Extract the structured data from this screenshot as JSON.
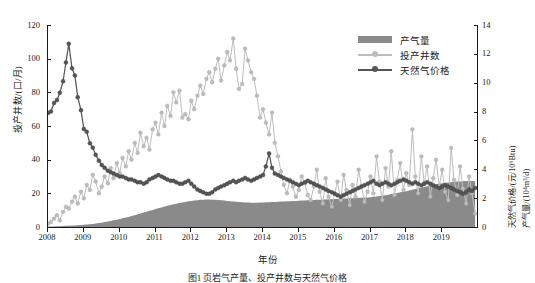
{
  "figure": {
    "caption": "图1   页岩气产量、投产井数与天然气价格"
  },
  "axes": {
    "x": {
      "label": "年份",
      "ticks": [
        "2008",
        "2009",
        "2010",
        "2011",
        "2012",
        "2013",
        "2014",
        "2015",
        "2016",
        "2017",
        "2018",
        "2019"
      ],
      "min": 2008,
      "max": 2020
    },
    "y_left": {
      "label": "投产井数/(口/月)",
      "ticks": [
        "0",
        "20",
        "40",
        "60",
        "80",
        "100",
        "120"
      ],
      "min": 0,
      "max": 120
    },
    "y_right": {
      "label_price": "天然气价格/(元/10⁶Btu)",
      "label_production": "产气量/(10⁴m³/d)",
      "ticks": [
        "0",
        "2",
        "4",
        "6",
        "8",
        "10",
        "12",
        "14"
      ],
      "min": 0,
      "max": 14
    }
  },
  "legend": {
    "position": "top-right",
    "items": [
      {
        "label": "产气量",
        "type": "area",
        "color": "#8a8a8a"
      },
      {
        "label": "投产井数",
        "type": "line",
        "color": "#bdbdbd"
      },
      {
        "label": "天然气价格",
        "type": "line",
        "color": "#565656"
      }
    ]
  },
  "colors": {
    "production_area": "#8a8a8a",
    "wells_line": "#bdbdbd",
    "price_line": "#565656",
    "axis": "#1a1a1a"
  },
  "chart_data": {
    "type": "line",
    "title": "",
    "subtitle": "",
    "xlabel": "年份",
    "ylabel": "投产井数/(口/月)",
    "ylabel_right": "天然气价格/(元/10⁶Btu); 产气量/(10⁴m³/d)",
    "xlim": [
      2008,
      2020
    ],
    "ylim": [
      0,
      120
    ],
    "ylim_right": [
      0,
      14
    ],
    "grid": false,
    "legend_position": "top-right",
    "x": [
      2008.0,
      2008.08,
      2008.17,
      2008.25,
      2008.33,
      2008.42,
      2008.5,
      2008.58,
      2008.67,
      2008.75,
      2008.83,
      2008.92,
      2009.0,
      2009.08,
      2009.17,
      2009.25,
      2009.33,
      2009.42,
      2009.5,
      2009.58,
      2009.67,
      2009.75,
      2009.83,
      2009.92,
      2010.0,
      2010.08,
      2010.17,
      2010.25,
      2010.33,
      2010.42,
      2010.5,
      2010.58,
      2010.67,
      2010.75,
      2010.83,
      2010.92,
      2011.0,
      2011.08,
      2011.17,
      2011.25,
      2011.33,
      2011.42,
      2011.5,
      2011.58,
      2011.67,
      2011.75,
      2011.83,
      2011.92,
      2012.0,
      2012.08,
      2012.17,
      2012.25,
      2012.33,
      2012.42,
      2012.5,
      2012.58,
      2012.67,
      2012.75,
      2012.83,
      2012.92,
      2013.0,
      2013.08,
      2013.17,
      2013.25,
      2013.33,
      2013.42,
      2013.5,
      2013.58,
      2013.67,
      2013.75,
      2013.83,
      2013.92,
      2014.0,
      2014.08,
      2014.17,
      2014.25,
      2014.33,
      2014.42,
      2014.5,
      2014.58,
      2014.67,
      2014.75,
      2014.83,
      2014.92,
      2015.0,
      2015.08,
      2015.17,
      2015.25,
      2015.33,
      2015.42,
      2015.5,
      2015.58,
      2015.67,
      2015.75,
      2015.83,
      2015.92,
      2016.0,
      2016.08,
      2016.17,
      2016.25,
      2016.33,
      2016.42,
      2016.5,
      2016.58,
      2016.67,
      2016.75,
      2016.83,
      2016.92,
      2017.0,
      2017.08,
      2017.17,
      2017.25,
      2017.33,
      2017.42,
      2017.5,
      2017.58,
      2017.67,
      2017.75,
      2017.83,
      2017.92,
      2018.0,
      2018.08,
      2018.17,
      2018.25,
      2018.33,
      2018.42,
      2018.5,
      2018.58,
      2018.67,
      2018.75,
      2018.83,
      2018.92,
      2019.0,
      2019.08,
      2019.17,
      2019.25,
      2019.33,
      2019.42,
      2019.5,
      2019.58,
      2019.67,
      2019.75,
      2019.83,
      2019.92
    ],
    "series": [
      {
        "name": "产气量",
        "type": "area",
        "axis": "right",
        "unit": "10⁴m³/d",
        "color": "#8a8a8a",
        "values": [
          0.02,
          0.03,
          0.04,
          0.05,
          0.06,
          0.07,
          0.08,
          0.09,
          0.1,
          0.11,
          0.12,
          0.13,
          0.15,
          0.17,
          0.19,
          0.21,
          0.24,
          0.27,
          0.3,
          0.34,
          0.38,
          0.42,
          0.46,
          0.5,
          0.55,
          0.6,
          0.65,
          0.7,
          0.76,
          0.82,
          0.88,
          0.94,
          1.0,
          1.06,
          1.12,
          1.18,
          1.24,
          1.3,
          1.36,
          1.42,
          1.47,
          1.52,
          1.57,
          1.62,
          1.66,
          1.7,
          1.74,
          1.78,
          1.81,
          1.84,
          1.86,
          1.88,
          1.89,
          1.9,
          1.9,
          1.89,
          1.88,
          1.87,
          1.85,
          1.83,
          1.81,
          1.79,
          1.77,
          1.75,
          1.73,
          1.71,
          1.7,
          1.69,
          1.68,
          1.68,
          1.68,
          1.69,
          1.7,
          1.71,
          1.72,
          1.73,
          1.74,
          1.75,
          1.76,
          1.77,
          1.78,
          1.79,
          1.8,
          1.81,
          1.82,
          1.83,
          1.84,
          1.85,
          1.86,
          1.87,
          1.88,
          1.89,
          1.9,
          1.91,
          1.92,
          1.93,
          1.94,
          1.95,
          1.96,
          1.97,
          1.98,
          1.99,
          2.0,
          2.01,
          2.02,
          2.03,
          2.04,
          2.05,
          2.07,
          2.09,
          2.11,
          2.14,
          2.17,
          2.2,
          2.24,
          2.28,
          2.32,
          2.36,
          2.4,
          2.44,
          2.48,
          2.53,
          2.58,
          2.63,
          2.68,
          2.73,
          2.78,
          2.83,
          2.88,
          2.92,
          2.96,
          3.0,
          3.03,
          3.06,
          3.09,
          3.11,
          3.13,
          3.15,
          3.16,
          3.17,
          3.18,
          3.18,
          3.18,
          3.17
        ]
      },
      {
        "name": "投产井数",
        "type": "line",
        "axis": "left",
        "unit": "口/月",
        "color": "#bdbdbd",
        "values": [
          2,
          3,
          5,
          7,
          4,
          9,
          12,
          11,
          15,
          18,
          14,
          21,
          17,
          25,
          22,
          31,
          27,
          20,
          24,
          30,
          26,
          35,
          29,
          38,
          32,
          41,
          36,
          45,
          40,
          50,
          44,
          56,
          48,
          53,
          46,
          58,
          62,
          55,
          68,
          60,
          72,
          66,
          80,
          74,
          81,
          65,
          67,
          64,
          75,
          70,
          78,
          84,
          79,
          88,
          92,
          86,
          94,
          100,
          87,
          96,
          104,
          99,
          112,
          94,
          82,
          85,
          106,
          99,
          92,
          88,
          78,
          65,
          70,
          62,
          55,
          68,
          50,
          42,
          33,
          25,
          20,
          28,
          24,
          18,
          22,
          30,
          26,
          19,
          16,
          24,
          34,
          21,
          14,
          29,
          18,
          12,
          20,
          27,
          16,
          31,
          22,
          13,
          25,
          18,
          34,
          24,
          15,
          21,
          30,
          20,
          42,
          27,
          16,
          35,
          24,
          45,
          19,
          28,
          38,
          22,
          32,
          25,
          58,
          30,
          20,
          42,
          26,
          36,
          18,
          29,
          40,
          24,
          34,
          21,
          16,
          47,
          28,
          19,
          36,
          23,
          14,
          30,
          20,
          8
        ]
      },
      {
        "name": "天然气价格",
        "type": "line",
        "axis": "right",
        "unit": "元/10⁶Btu",
        "color": "#565656",
        "values": [
          7.9,
          8.0,
          8.6,
          8.8,
          9.3,
          10.1,
          11.4,
          12.7,
          11.0,
          10.5,
          9.0,
          8.1,
          6.8,
          6.6,
          5.8,
          5.5,
          5.0,
          4.6,
          4.3,
          4.1,
          3.9,
          3.8,
          3.7,
          3.6,
          3.5,
          3.5,
          3.4,
          3.3,
          3.3,
          3.2,
          3.1,
          3.1,
          3.0,
          3.1,
          3.3,
          3.4,
          3.5,
          3.6,
          3.5,
          3.4,
          3.3,
          3.2,
          3.2,
          3.1,
          3.0,
          3.0,
          3.1,
          3.2,
          3.0,
          2.8,
          2.6,
          2.5,
          2.4,
          2.3,
          2.3,
          2.4,
          2.6,
          2.7,
          2.8,
          2.9,
          3.0,
          3.1,
          3.2,
          3.1,
          3.2,
          3.3,
          3.4,
          3.3,
          3.2,
          3.3,
          3.4,
          3.5,
          3.6,
          4.2,
          5.1,
          4.1,
          3.7,
          3.6,
          3.5,
          3.4,
          3.3,
          3.2,
          3.1,
          3.0,
          2.9,
          3.0,
          3.1,
          3.2,
          3.1,
          3.0,
          2.9,
          2.8,
          2.7,
          2.6,
          2.5,
          2.4,
          2.3,
          2.2,
          2.1,
          2.2,
          2.3,
          2.4,
          2.5,
          2.6,
          2.7,
          2.8,
          2.9,
          3.0,
          3.1,
          3.2,
          3.0,
          2.9,
          3.0,
          3.1,
          3.0,
          2.9,
          3.0,
          3.1,
          3.2,
          3.3,
          3.2,
          3.1,
          3.0,
          3.1,
          3.0,
          2.9,
          3.0,
          3.1,
          3.0,
          2.9,
          2.8,
          2.7,
          2.8,
          2.9,
          2.8,
          2.7,
          2.6,
          2.5,
          2.4,
          2.3,
          2.4,
          2.6,
          2.5,
          2.7
        ]
      }
    ]
  }
}
